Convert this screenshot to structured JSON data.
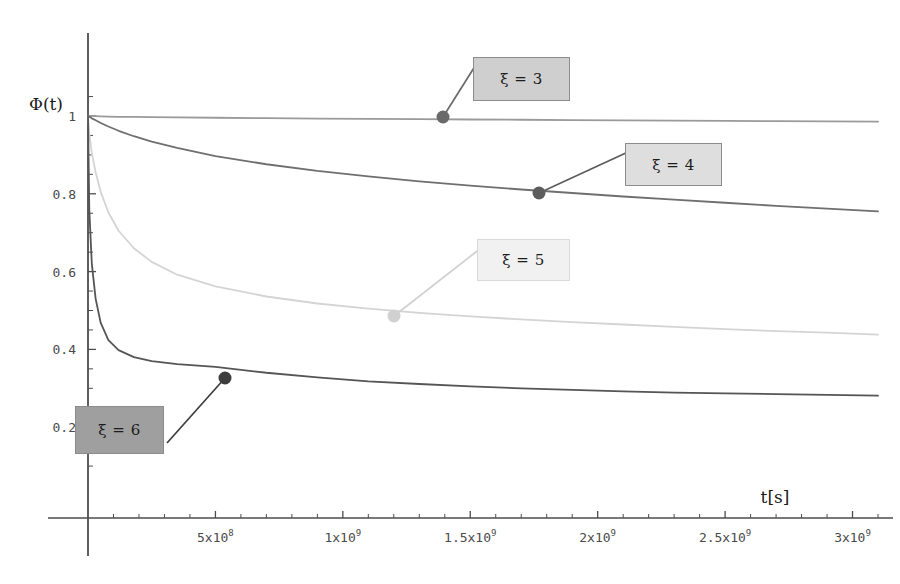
{
  "figure": {
    "background_color": "#ffffff",
    "axis_color": "#4d4d4d",
    "y_axis_title": "Φ(t)",
    "x_axis_title": "t[s]"
  },
  "axes": {
    "x": {
      "min": 0,
      "max": 3100000000.0,
      "pixel_origin": 88,
      "pixel_per_unit": 2.6e-07,
      "tick_labels": [
        {
          "value": 500000000,
          "mantissa": "5x10",
          "exponent": "8"
        },
        {
          "value": 1000000000,
          "mantissa": "1x10",
          "exponent": "9"
        },
        {
          "value": 1500000000,
          "mantissa": "1.5x10",
          "exponent": "9"
        },
        {
          "value": 2000000000,
          "mantissa": "2x10",
          "exponent": "9"
        },
        {
          "value": 2500000000,
          "mantissa": "2.5x10",
          "exponent": "9"
        },
        {
          "value": 3000000000,
          "mantissa": "3x10",
          "exponent": "9"
        }
      ],
      "minor_tick_count_between": 4
    },
    "y": {
      "min": 0.12,
      "max": 1.06,
      "pixel_origin_value": 1,
      "pixel_origin": 116,
      "pixel_per_unit": 389,
      "tick_labels": [
        {
          "value": 1,
          "label": "1"
        },
        {
          "value": 0.8,
          "label": "0.8"
        },
        {
          "value": 0.6,
          "label": "0.6"
        },
        {
          "value": 0.4,
          "label": "0.4"
        },
        {
          "value": 0.2,
          "label": "0.2"
        }
      ],
      "minor_tick_count_between": 4
    }
  },
  "chart_data": {
    "type": "line",
    "title": "",
    "xlabel": "t[s]",
    "ylabel": "Φ(t)",
    "xlim": [
      0,
      3100000000
    ],
    "ylim": [
      0.12,
      1.06
    ],
    "grid": false,
    "legend_position": "inline-callout-boxes",
    "x": [
      0,
      5000000,
      15000000,
      30000000,
      50000000,
      80000000,
      120000000,
      180000000,
      250000000,
      350000000,
      500000000,
      700000000,
      900000000,
      1100000000,
      1300000000,
      1500000000,
      1700000000,
      1900000000,
      2100000000,
      2300000000,
      2500000000,
      2700000000,
      2900000000,
      3100000000
    ],
    "series": [
      {
        "name": "ξ = 3",
        "label": "ξ = 3",
        "color": "#9a9a9a",
        "values": [
          1.0,
          1.0,
          1.0,
          0.9995,
          0.999,
          0.9985,
          0.998,
          0.9975,
          0.997,
          0.9963,
          0.9955,
          0.9945,
          0.9935,
          0.9925,
          0.9918,
          0.991,
          0.9903,
          0.9895,
          0.9888,
          0.988,
          0.9873,
          0.9866,
          0.986,
          0.9855
        ],
        "marker": {
          "x": 1370000000,
          "y": 0.992
        }
      },
      {
        "name": "ξ = 4",
        "label": "ξ = 4",
        "color": "#6f6f6f",
        "values": [
          1.0,
          0.998,
          0.994,
          0.989,
          0.982,
          0.973,
          0.962,
          0.948,
          0.934,
          0.918,
          0.897,
          0.876,
          0.859,
          0.845,
          0.832,
          0.821,
          0.811,
          0.802,
          0.793,
          0.785,
          0.777,
          0.769,
          0.762,
          0.755
        ],
        "marker": {
          "x": 1730000000,
          "y": 0.808
        }
      },
      {
        "name": "ξ = 5",
        "label": "ξ = 5",
        "color": "#d4d4d4",
        "values": [
          1.0,
          0.955,
          0.905,
          0.855,
          0.805,
          0.752,
          0.705,
          0.66,
          0.625,
          0.592,
          0.562,
          0.536,
          0.518,
          0.505,
          0.494,
          0.485,
          0.477,
          0.47,
          0.464,
          0.458,
          0.452,
          0.447,
          0.443,
          0.438
        ],
        "marker": {
          "x": 1190000000,
          "y": 0.5
        }
      },
      {
        "name": "ξ = 6",
        "label": "ξ = 6",
        "color": "#555555",
        "values": [
          1.0,
          0.76,
          0.62,
          0.53,
          0.468,
          0.424,
          0.398,
          0.38,
          0.37,
          0.362,
          0.355,
          0.34,
          0.328,
          0.318,
          0.311,
          0.305,
          0.3,
          0.296,
          0.292,
          0.289,
          0.287,
          0.285,
          0.283,
          0.281
        ],
        "marker": {
          "x": 530000000,
          "y": 0.355
        }
      }
    ]
  },
  "callouts": [
    {
      "id": "callout-xi-3",
      "text": "ξ = 3",
      "box": {
        "left": 473,
        "top": 57,
        "width": 97,
        "height": 44
      },
      "fill": "#cfcfcf",
      "border": "#8c8c8c",
      "leader": {
        "x1": 443,
        "y1": 117,
        "x2": 477,
        "y2": 63
      },
      "marker_color": "#6a6a6a"
    },
    {
      "id": "callout-xi-4",
      "text": "ξ = 4",
      "box": {
        "left": 625,
        "top": 143,
        "width": 97,
        "height": 43
      },
      "fill": "#dedede",
      "border": "#8c8c8c",
      "leader": {
        "x1": 539,
        "y1": 193,
        "x2": 628,
        "y2": 152
      },
      "marker_color": "#5c5c5c"
    },
    {
      "id": "callout-xi-5",
      "text": "ξ = 5",
      "box": {
        "left": 477,
        "top": 239,
        "width": 93,
        "height": 42
      },
      "fill": "#f1f1f1",
      "border": "#d9d9d9",
      "leader": {
        "x1": 394,
        "y1": 316,
        "x2": 481,
        "y2": 248
      },
      "marker_color": "#d0d0d0"
    },
    {
      "id": "callout-xi-6",
      "text": "ξ = 6",
      "box": {
        "left": 75,
        "top": 406,
        "width": 89,
        "height": 48
      },
      "fill": "#9f9f9f",
      "border": "#8c8c8c",
      "leader": {
        "x1": 225,
        "y1": 378,
        "x2": 167,
        "y2": 443
      },
      "marker_color": "#3d3d3d"
    }
  ]
}
